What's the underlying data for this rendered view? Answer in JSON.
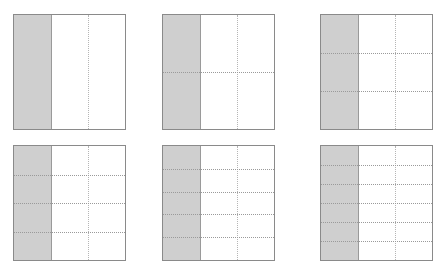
{
  "diagram": {
    "title": "",
    "colors": {
      "shade": "#cfcfcf",
      "border": "#8a8a8a",
      "grid_line": "#b5b5b5",
      "background": "#ffffff"
    },
    "grids": [
      {
        "id": "grid-1",
        "columns": 3,
        "rows": 1,
        "shaded_columns": 1,
        "x": 13,
        "y": 14
      },
      {
        "id": "grid-2",
        "columns": 3,
        "rows": 2,
        "shaded_columns": 1,
        "x": 162,
        "y": 14
      },
      {
        "id": "grid-3",
        "columns": 3,
        "rows": 3,
        "shaded_columns": 1,
        "x": 320,
        "y": 14
      },
      {
        "id": "grid-4",
        "columns": 3,
        "rows": 4,
        "shaded_columns": 1,
        "x": 13,
        "y": 145
      },
      {
        "id": "grid-5",
        "columns": 3,
        "rows": 5,
        "shaded_columns": 1,
        "x": 162,
        "y": 145
      },
      {
        "id": "grid-6",
        "columns": 3,
        "rows": 6,
        "shaded_columns": 1,
        "x": 320,
        "y": 145
      }
    ]
  }
}
